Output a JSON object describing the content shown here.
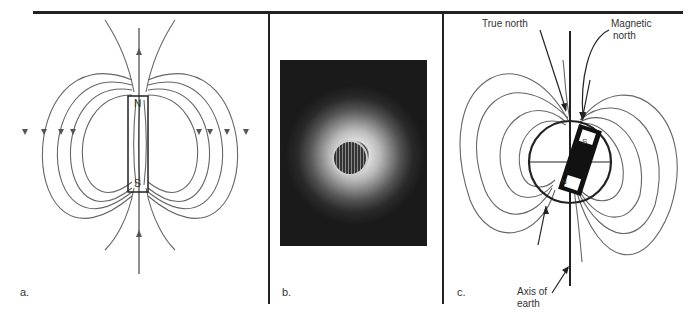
{
  "figure": {
    "panels": [
      {
        "id": "a",
        "label": "a.",
        "magnet": {
          "north_label": "N",
          "south_label": "S"
        }
      },
      {
        "id": "b",
        "label": "b."
      },
      {
        "id": "c",
        "label": "c.",
        "magnet": {
          "north_label": "N",
          "south_label": "S"
        },
        "annotations": {
          "true_north": "True north",
          "magnetic_north": "Magnetic north",
          "axis": "Axis of earth"
        }
      }
    ]
  },
  "labels": {
    "a": "a.",
    "b": "b.",
    "c": "c.",
    "true_north": "True north",
    "magnetic_line1": "Magnetic",
    "magnetic_line2": "north",
    "axis_line1": "Axis of",
    "axis_line2": "earth",
    "n": "N",
    "s": "S"
  }
}
